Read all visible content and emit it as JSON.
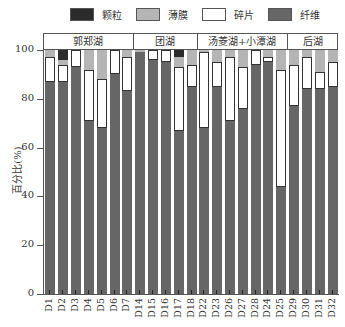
{
  "legend": {
    "items": [
      {
        "key": "particle",
        "label": "颗粒",
        "color": "#2b2b2b"
      },
      {
        "key": "film",
        "label": "薄膜",
        "color": "#b5b5b5"
      },
      {
        "key": "fragment",
        "label": "碎片",
        "color": "#ffffff"
      },
      {
        "key": "fiber",
        "label": "纤维",
        "color": "#666666"
      }
    ]
  },
  "groups": [
    {
      "label": "郭郑湖",
      "start": 0,
      "count": 7
    },
    {
      "label": "团湖",
      "start": 7,
      "count": 5
    },
    {
      "label": "汤菱湖+小潭湖",
      "start": 12,
      "count": 7
    },
    {
      "label": "后湖",
      "start": 19,
      "count": 4
    }
  ],
  "y_axis": {
    "label": "百分比(%)",
    "ticks": [
      "0",
      "20",
      "40",
      "60",
      "80",
      "100"
    ]
  },
  "chart_data": {
    "type": "bar",
    "stacked": true,
    "title": "",
    "xlabel": "",
    "ylabel": "百分比(%)",
    "ylim": [
      0,
      100
    ],
    "grid": false,
    "legend_position": "top",
    "categories": [
      "D1",
      "D2",
      "D3",
      "D4",
      "D5",
      "D6",
      "D7",
      "D14",
      "D15",
      "D16",
      "D17",
      "D18",
      "D22",
      "D23",
      "D26",
      "D27",
      "D28",
      "D24",
      "D25",
      "D29",
      "D30",
      "D31",
      "D32"
    ],
    "group_labels": [
      "郭郑湖",
      "团湖",
      "汤菱湖+小潭湖",
      "后湖"
    ],
    "series": [
      {
        "name": "纤维",
        "key": "fiber",
        "color": "#666666",
        "values": [
          87,
          87,
          93,
          71,
          68,
          90,
          83,
          99,
          96,
          95,
          67,
          85,
          68,
          85,
          71,
          76,
          94,
          95,
          44,
          77,
          84,
          84,
          85
        ]
      },
      {
        "name": "碎片",
        "key": "fragment",
        "color": "#ffffff",
        "values": [
          10,
          7,
          7,
          21,
          20,
          10,
          14,
          0,
          4,
          5,
          26,
          9,
          31,
          10,
          26,
          17,
          6,
          2,
          48,
          17,
          13,
          7,
          10
        ]
      },
      {
        "name": "薄膜",
        "key": "film",
        "color": "#b5b5b5",
        "values": [
          3,
          2,
          0,
          8,
          12,
          0,
          3,
          1,
          0,
          0,
          4,
          6,
          1,
          5,
          3,
          7,
          0,
          3,
          8,
          6,
          3,
          9,
          5
        ]
      },
      {
        "name": "颗粒",
        "key": "particle",
        "color": "#2b2b2b",
        "values": [
          0,
          4,
          0,
          0,
          0,
          0,
          0,
          0,
          0,
          0,
          3,
          0,
          0,
          0,
          0,
          0,
          0,
          0,
          0,
          0,
          0,
          0,
          0
        ]
      }
    ]
  }
}
